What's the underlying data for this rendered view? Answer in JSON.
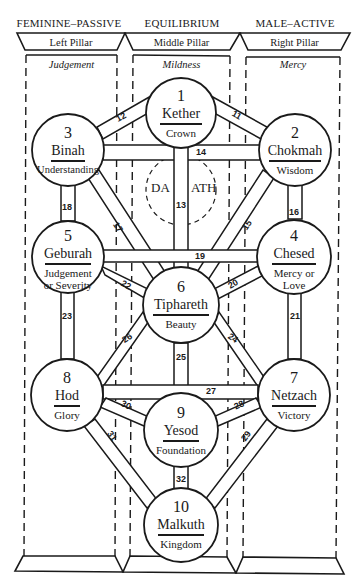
{
  "pillars": [
    {
      "polarity": "FEMININE–PASSIVE",
      "name": "Left Pillar",
      "quality": "Judgement"
    },
    {
      "polarity": "EQUILIBRIUM",
      "name": "Middle Pillar",
      "quality": "Mildness"
    },
    {
      "polarity": "MALE–ACTIVE",
      "name": "Right Pillar",
      "quality": "Mercy"
    }
  ],
  "sephiroth": [
    {
      "number": "1",
      "name": "Kether",
      "translation": "Crown"
    },
    {
      "number": "2",
      "name": "Chokmah",
      "translation": "Wisdom"
    },
    {
      "number": "3",
      "name": "Binah",
      "translation": "Understanding"
    },
    {
      "number": "4",
      "name": "Chesed",
      "translation": "Mercy or",
      "translation2": "Love"
    },
    {
      "number": "5",
      "name": "Geburah",
      "translation": "Judgement",
      "translation2": "or Severity"
    },
    {
      "number": "6",
      "name": "Tiphareth",
      "translation": "Beauty"
    },
    {
      "number": "7",
      "name": "Netzach",
      "translation": "Victory"
    },
    {
      "number": "8",
      "name": "Hod",
      "translation": "Glory"
    },
    {
      "number": "9",
      "name": "Yesod",
      "translation": "Foundation"
    },
    {
      "number": "10",
      "name": "Malkuth",
      "translation": "Kingdom"
    }
  ],
  "daath": {
    "left": "DA",
    "right": "ATH"
  },
  "paths": [
    "11",
    "12",
    "13",
    "14",
    "15",
    "16",
    "17",
    "18",
    "19",
    "20",
    "21",
    "22",
    "23",
    "24",
    "25",
    "26",
    "27",
    "28",
    "29",
    "30",
    "31",
    "32"
  ]
}
